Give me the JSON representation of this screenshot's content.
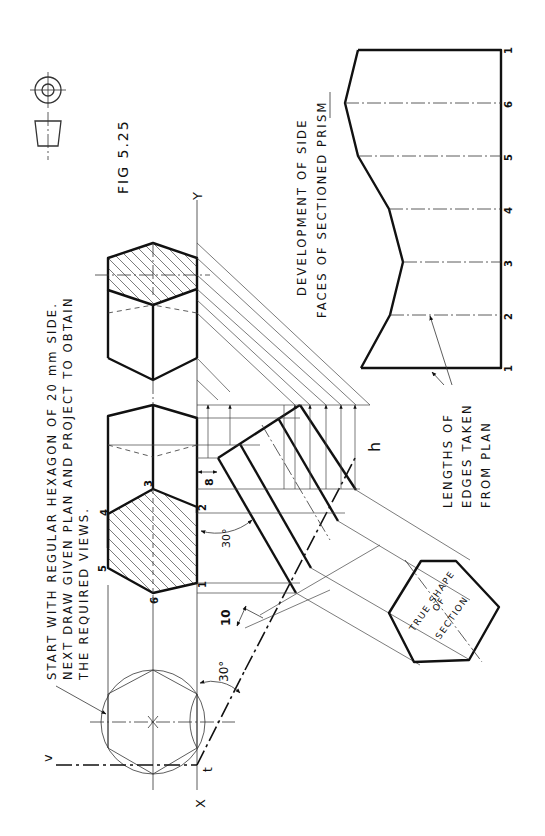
{
  "figure": {
    "title": "FIG 5.25",
    "orientation": "rotated 90 degrees counter-clockwise",
    "projection_symbol": "first-angle-projection-symbol"
  },
  "instructions": {
    "line1": "START WITH REGULAR HEXAGON OF 20 mm SIDE.",
    "line2": "NEXT DRAW GIVEN PLAN AND PROJECT TO OBTAIN",
    "line3": "THE REQUIRED VIEWS."
  },
  "development_label": {
    "line1": "DEVELOPMENT OF SIDE",
    "line2": "FACES OF SECTIONED PRISM"
  },
  "edges_note": {
    "line1": "LENGTHS OF",
    "line2": "EDGES TAKEN",
    "line3": "FROM PLAN"
  },
  "true_shape_label": {
    "line1": "TRUE SHAPE",
    "line2": "OF",
    "line3": "SECTION"
  },
  "reference_line": {
    "x_label": "X",
    "y_label": "Y",
    "cutting_plane_start": "v",
    "cutting_plane_corner": "t",
    "cutting_plane_end": "h"
  },
  "dimensions": {
    "angle_plane": "30°",
    "angle_section": "30°",
    "offset_a": "8",
    "offset_b": "10"
  },
  "plan_vertices": [
    "1",
    "2",
    "3",
    "4",
    "5",
    "6"
  ],
  "development_stations": [
    "1",
    "2",
    "3",
    "4",
    "5",
    "6",
    "1"
  ]
}
